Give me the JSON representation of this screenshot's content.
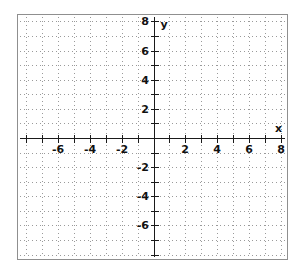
{
  "figure": {
    "kind": "coordinate-grid",
    "background_color": "#ffffff",
    "frame_color": "#8f8f8f",
    "axis_color": "#1a1a1a",
    "grid_color": "#9a9a9a",
    "label_color": "#111111"
  },
  "chart_data": {
    "type": "scatter",
    "title": "",
    "subtitle": "",
    "xlabel": "x",
    "ylabel": "y",
    "xlim": [
      -8.4,
      8.4
    ],
    "ylim": [
      -8.3,
      8.3
    ],
    "xticks": [
      -8,
      -7,
      -6,
      -5,
      -4,
      -3,
      -2,
      -1,
      1,
      2,
      3,
      4,
      5,
      6,
      7,
      8
    ],
    "yticks": [
      -8,
      -7,
      -6,
      -5,
      -4,
      -3,
      -2,
      -1,
      1,
      2,
      3,
      4,
      5,
      6,
      7,
      8
    ],
    "xticklabels": [
      {
        "value": -6,
        "text": "-6"
      },
      {
        "value": -4,
        "text": "-4"
      },
      {
        "value": -2,
        "text": "-2"
      },
      {
        "value": 2,
        "text": "2"
      },
      {
        "value": 4,
        "text": "4"
      },
      {
        "value": 6,
        "text": "6"
      },
      {
        "value": 8,
        "text": "8"
      }
    ],
    "yticklabels": [
      {
        "value": 8,
        "text": "8"
      },
      {
        "value": 6,
        "text": "6"
      },
      {
        "value": 4,
        "text": "4"
      },
      {
        "value": 2,
        "text": "2"
      },
      {
        "value": -2,
        "text": "-2"
      },
      {
        "value": -4,
        "text": "-4"
      },
      {
        "value": -6,
        "text": "-6"
      }
    ],
    "grid": true,
    "grid_style": "dotted",
    "grid_step": 1,
    "legend": null,
    "series": [],
    "x": [],
    "values": [],
    "annotations": []
  },
  "axis_labels": {
    "x": "x",
    "y": "y"
  }
}
